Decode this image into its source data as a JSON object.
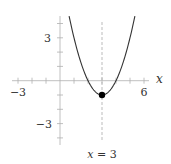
{
  "chart_data": {
    "type": "line",
    "title": "",
    "function": "y = (x - 3)^2 - 1",
    "xlabel": "x",
    "ylabel": "",
    "xlim": [
      -3,
      6
    ],
    "ylim": [
      -4,
      4.5
    ],
    "grid": false,
    "x_ticks": [
      -3,
      -2,
      -1,
      1,
      2,
      3,
      4,
      5,
      6
    ],
    "y_ticks": [
      -4,
      -3,
      -2,
      -1,
      1,
      2,
      3,
      4
    ],
    "x_tick_labels": [
      {
        "value": -3,
        "label": "−3"
      },
      {
        "value": 6,
        "label": "6"
      }
    ],
    "y_tick_labels": [
      {
        "value": 3,
        "label": "3"
      },
      {
        "value": -3,
        "label": "−3"
      }
    ],
    "series": [
      {
        "name": "parabola",
        "x": [
          0.65,
          1,
          1.5,
          2,
          2.5,
          3,
          3.5,
          4,
          4.5,
          5,
          5.35
        ],
        "y": [
          4.5,
          3,
          1.25,
          0,
          -0.75,
          -1,
          -0.75,
          0,
          1.25,
          3,
          4.5
        ],
        "color": "#333333"
      }
    ],
    "vertex": {
      "x": 3,
      "y": -1
    },
    "axis_of_symmetry": {
      "x": 3,
      "label_var": "x",
      "label_rest": " = 3",
      "style": "dashed",
      "color": "#aaaaaa"
    },
    "colors": {
      "axes": "#b0b0b0",
      "curve": "#333333",
      "dashed": "#aaaaaa",
      "point": "#000000"
    }
  }
}
